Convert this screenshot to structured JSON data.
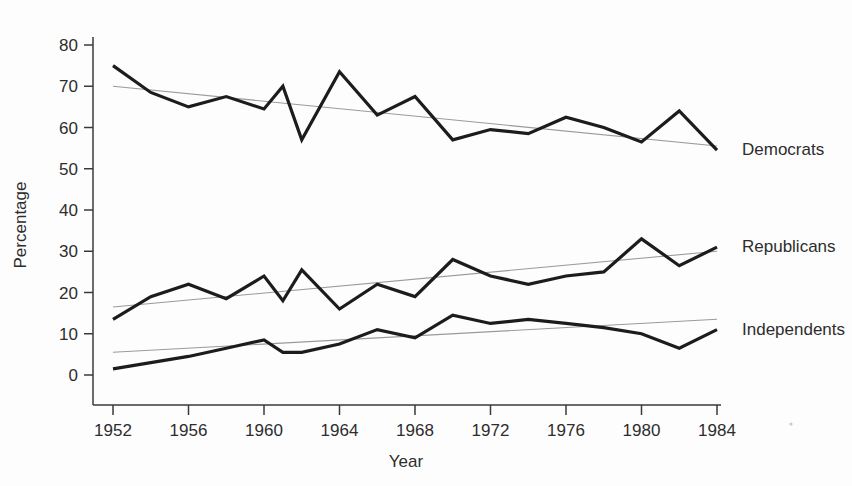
{
  "chart_data": {
    "type": "line",
    "title": "",
    "xlabel": "Year",
    "ylabel": "Percentage",
    "xlim": [
      1952,
      1984
    ],
    "ylim": [
      0,
      80
    ],
    "grid": false,
    "legend_position": "right-inline-labels",
    "x": [
      1952,
      1954,
      1956,
      1958,
      1960,
      1961,
      1962,
      1964,
      1966,
      1968,
      1970,
      1972,
      1974,
      1976,
      1978,
      1980,
      1982,
      1984
    ],
    "xticks": [
      1952,
      1956,
      1960,
      1964,
      1968,
      1972,
      1976,
      1980,
      1984
    ],
    "xtick_labels": [
      "1952",
      "1956",
      "1960",
      "1964",
      "1968",
      "1972",
      "1976",
      "1980",
      "1984"
    ],
    "yticks": [
      0,
      10,
      20,
      30,
      40,
      50,
      60,
      70,
      80
    ],
    "ytick_labels": [
      "0",
      "10",
      "20",
      "30",
      "40",
      "50",
      "60",
      "70",
      "80"
    ],
    "series": [
      {
        "name": "Democrats",
        "label": "Democrats",
        "color": "#1c1c1c",
        "values": [
          75.0,
          68.5,
          65.0,
          67.5,
          64.5,
          70.0,
          57.0,
          73.5,
          63.0,
          67.5,
          57.0,
          59.5,
          58.5,
          62.5,
          60.0,
          56.5,
          64.0,
          54.5
        ],
        "trend": {
          "start_value": 70.0,
          "end_value": 55.5,
          "color": "#9a9a9a"
        }
      },
      {
        "name": "Republicans",
        "label": "Republicans",
        "color": "#1c1c1c",
        "values": [
          13.5,
          19.0,
          22.0,
          18.5,
          24.0,
          18.0,
          25.5,
          16.0,
          22.0,
          19.0,
          28.0,
          24.0,
          22.0,
          24.0,
          25.0,
          33.0,
          26.5,
          31.0
        ],
        "trend": {
          "start_value": 16.5,
          "end_value": 30.0,
          "color": "#9a9a9a"
        }
      },
      {
        "name": "Independents",
        "label": "Independents",
        "color": "#1c1c1c",
        "values": [
          1.5,
          3.0,
          4.5,
          6.5,
          8.5,
          5.5,
          5.5,
          7.5,
          11.0,
          9.0,
          14.5,
          12.5,
          13.5,
          12.5,
          11.5,
          10.0,
          6.5,
          11.0
        ],
        "trend": {
          "start_value": 5.5,
          "end_value": 13.5,
          "color": "#9a9a9a"
        }
      }
    ]
  },
  "axes": {
    "y_axis_title": "Percentage",
    "x_axis_title": "Year"
  }
}
